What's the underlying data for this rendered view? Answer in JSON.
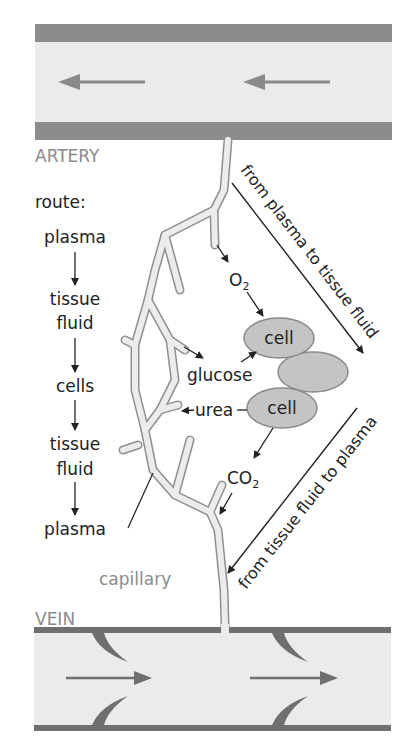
{
  "labels": {
    "artery": "ARTERY",
    "vein": "VEIN",
    "capillary": "capillary",
    "route_title": "route:",
    "route": [
      "plasma",
      "tissue",
      "fluid",
      "cells",
      "tissue",
      "fluid",
      "plasma"
    ],
    "oxygen": "O",
    "oxygen_sub": "2",
    "co2": "CO",
    "co2_sub": "2",
    "glucose": "glucose",
    "urea": "urea",
    "cell_top": "cell",
    "cell_bottom": "cell",
    "to_tissue": "from plasma to tissue fluid",
    "to_plasma": "from tissue fluid to plasma"
  },
  "colors": {
    "vessel_wall": "#8c8c8c",
    "vessel_fill": "#ebebeb",
    "cell_fill": "#c4c4c4",
    "cell_stroke": "#8a8a8a",
    "capillary_fill": "#ececec",
    "capillary_stroke": "#8f8f8f",
    "text": "#222222",
    "gray_text": "#8a8a8a"
  }
}
